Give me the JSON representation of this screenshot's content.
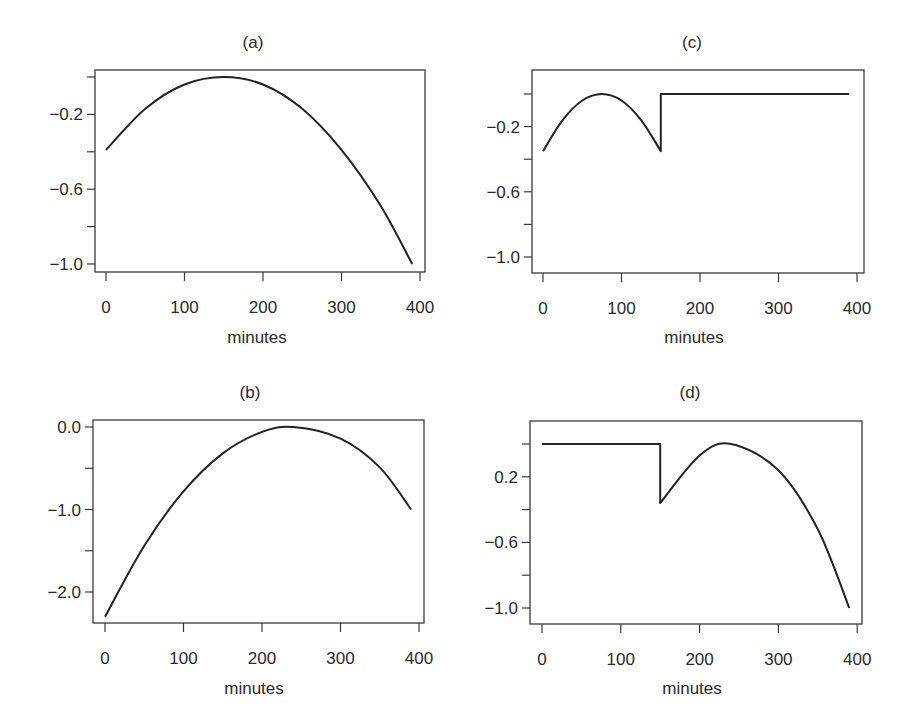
{
  "figure": {
    "panels": [
      {
        "id": "a",
        "title": "(a)",
        "xlabel": "minutes",
        "x_tick_labels": [
          "0",
          "100",
          "200",
          "300",
          "400"
        ],
        "y_tick_labels": [
          "",
          "−0.2",
          "",
          "−0.6",
          "",
          "−1.0"
        ]
      },
      {
        "id": "c",
        "title": "(c)",
        "xlabel": "minutes",
        "x_tick_labels": [
          "0",
          "100",
          "200",
          "300",
          "400"
        ],
        "y_tick_labels": [
          "",
          "−0.2",
          "",
          "−0.6",
          "",
          "−1.0"
        ]
      },
      {
        "id": "b",
        "title": "(b)",
        "xlabel": "minutes",
        "x_tick_labels": [
          "0",
          "100",
          "200",
          "300",
          "400"
        ],
        "y_tick_labels": [
          "0.0",
          "",
          "−1.0",
          "",
          "−2.0"
        ]
      },
      {
        "id": "d",
        "title": "(d)",
        "xlabel": "minutes",
        "x_tick_labels": [
          "0",
          "100",
          "200",
          "300",
          "400"
        ],
        "y_tick_labels": [
          "",
          "0.2",
          "",
          "−0.6",
          "",
          "−1.0"
        ]
      }
    ]
  },
  "chart_data": [
    {
      "type": "line",
      "title": "(a)",
      "xlabel": "minutes",
      "ylabel": "",
      "xlim": [
        0,
        400
      ],
      "ylim": [
        -1.05,
        0.03
      ],
      "x_ticks": [
        0,
        100,
        200,
        300,
        400
      ],
      "y_ticks": [
        0.0,
        -0.2,
        -0.4,
        -0.6,
        -0.8,
        -1.0
      ],
      "y_tick_labels": [
        "",
        "-0.2",
        "",
        "-0.6",
        "",
        "-1.0"
      ],
      "grid": false,
      "legend": null,
      "series": [
        {
          "name": "curve",
          "x": [
            0,
            50,
            100,
            150,
            200,
            250,
            300,
            350,
            390
          ],
          "y": [
            -0.39,
            -0.17,
            -0.04,
            0.0,
            -0.04,
            -0.17,
            -0.39,
            -0.69,
            -1.0
          ]
        }
      ]
    },
    {
      "type": "line",
      "title": "(c)",
      "xlabel": "minutes",
      "ylabel": "",
      "xlim": [
        0,
        400
      ],
      "ylim": [
        -1.1,
        0.15
      ],
      "x_ticks": [
        0,
        100,
        200,
        300,
        400
      ],
      "y_ticks": [
        0.0,
        -0.2,
        -0.4,
        -0.6,
        -0.8,
        -1.0
      ],
      "y_tick_labels": [
        "",
        "-0.2",
        "",
        "-0.6",
        "",
        "-1.0"
      ],
      "grid": false,
      "legend": null,
      "series": [
        {
          "name": "curve",
          "x": [
            0,
            25,
            50,
            75,
            100,
            125,
            150,
            150,
            200,
            300,
            390
          ],
          "y": [
            -0.35,
            -0.16,
            -0.04,
            0.0,
            -0.04,
            -0.16,
            -0.35,
            0.0,
            0.0,
            0.0,
            0.0
          ]
        }
      ]
    },
    {
      "type": "line",
      "title": "(b)",
      "xlabel": "minutes",
      "ylabel": "",
      "xlim": [
        0,
        400
      ],
      "ylim": [
        -2.4,
        0.08
      ],
      "x_ticks": [
        0,
        100,
        200,
        300,
        400
      ],
      "y_ticks": [
        0.0,
        -0.5,
        -1.0,
        -1.5,
        -2.0
      ],
      "y_tick_labels": [
        "0.0",
        "",
        "-1.0",
        "",
        "-2.0"
      ],
      "grid": false,
      "legend": null,
      "series": [
        {
          "name": "curve",
          "x": [
            0,
            50,
            100,
            150,
            200,
            240,
            300,
            350,
            390
          ],
          "y": [
            -2.3,
            -1.44,
            -0.78,
            -0.32,
            -0.06,
            0.0,
            -0.14,
            -0.49,
            -1.0
          ]
        }
      ]
    },
    {
      "type": "line",
      "title": "(d)",
      "xlabel": "minutes",
      "ylabel": "",
      "xlim": [
        0,
        400
      ],
      "ylim": [
        -1.1,
        0.15
      ],
      "x_ticks": [
        0,
        100,
        200,
        300,
        400
      ],
      "y_ticks": [
        0.0,
        -0.2,
        -0.4,
        -0.6,
        -0.8,
        -1.0
      ],
      "y_tick_labels": [
        "",
        "0.2",
        "",
        "-0.6",
        "",
        "-1.0"
      ],
      "grid": false,
      "legend": null,
      "series": [
        {
          "name": "curve",
          "x": [
            0,
            100,
            150,
            150,
            200,
            240,
            300,
            350,
            390
          ],
          "y": [
            0.0,
            0.0,
            0.0,
            -0.36,
            -0.07,
            0.0,
            -0.16,
            -0.52,
            -1.0
          ]
        }
      ]
    }
  ]
}
